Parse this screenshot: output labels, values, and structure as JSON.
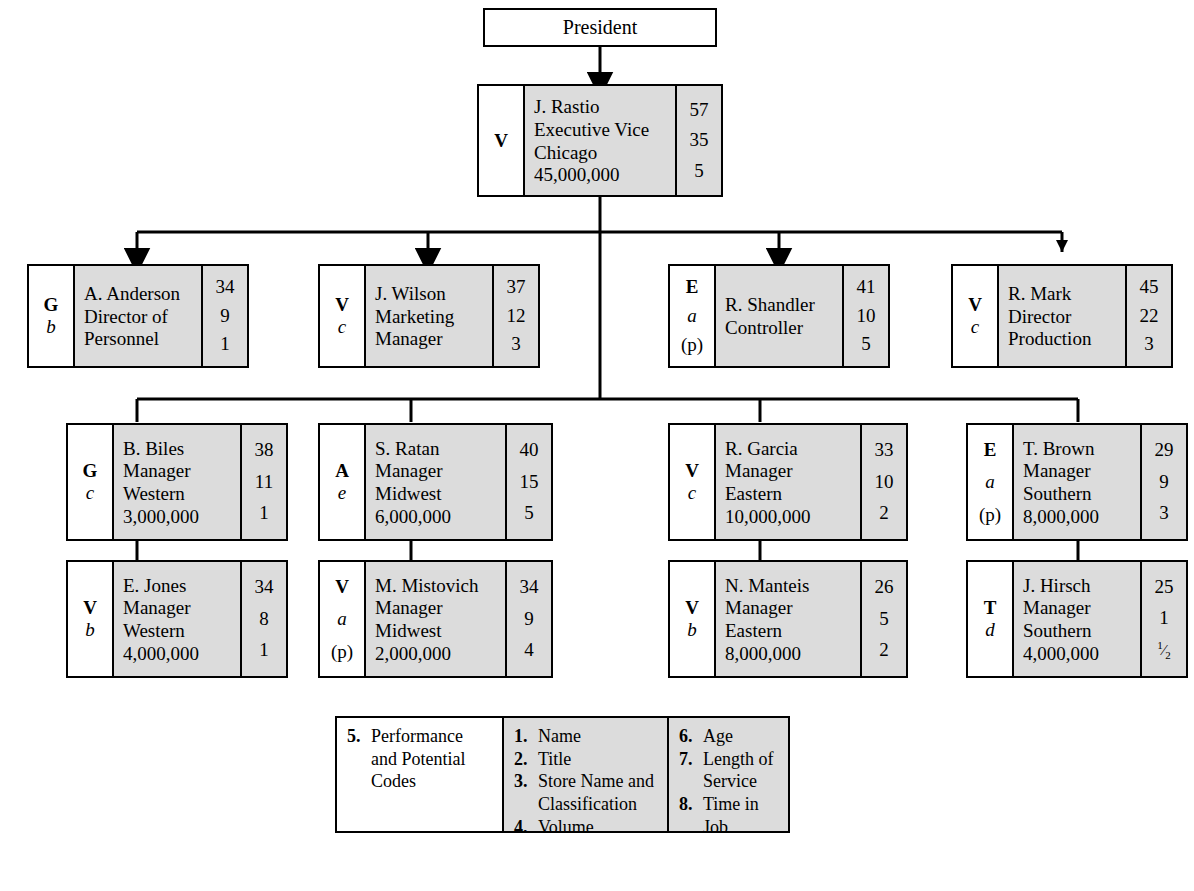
{
  "chart_title": "Organization Chart",
  "root": {
    "label": "President"
  },
  "nodes": [
    {
      "id": "rastio",
      "perf_code": "V",
      "potential_code": "",
      "paren_code": "",
      "name": "J. Rastio",
      "title": "Executive Vice",
      "store": "Chicago",
      "volume": "45,000,000",
      "age": "57",
      "length_of_service": "35",
      "time_in_job": "5"
    },
    {
      "id": "anderson",
      "perf_code": "G",
      "potential_code": "b",
      "paren_code": "",
      "name": "A. Anderson",
      "title": "Director of",
      "store": "Personnel",
      "volume": "",
      "age": "34",
      "length_of_service": "9",
      "time_in_job": "1"
    },
    {
      "id": "wilson",
      "perf_code": "V",
      "potential_code": "c",
      "paren_code": "",
      "name": "J. Wilson",
      "title": "Marketing",
      "store": "Manager",
      "volume": "",
      "age": "37",
      "length_of_service": "12",
      "time_in_job": "3"
    },
    {
      "id": "shandler",
      "perf_code": "E",
      "potential_code": "a",
      "paren_code": "(p)",
      "name": "R. Shandler",
      "title": "Controller",
      "store": "",
      "volume": "",
      "age": "41",
      "length_of_service": "10",
      "time_in_job": "5"
    },
    {
      "id": "mark",
      "perf_code": "V",
      "potential_code": "c",
      "paren_code": "",
      "name": "R. Mark",
      "title": "Director",
      "store": "Production",
      "volume": "",
      "age": "45",
      "length_of_service": "22",
      "time_in_job": "3"
    },
    {
      "id": "biles",
      "perf_code": "G",
      "potential_code": "c",
      "paren_code": "",
      "name": "B. Biles",
      "title": "Manager",
      "store": "Western",
      "volume": "3,000,000",
      "age": "38",
      "length_of_service": "11",
      "time_in_job": "1"
    },
    {
      "id": "ratan",
      "perf_code": "A",
      "potential_code": "e",
      "paren_code": "",
      "name": "S. Ratan",
      "title": "Manager",
      "store": "Midwest",
      "volume": "6,000,000",
      "age": "40",
      "length_of_service": "15",
      "time_in_job": "5"
    },
    {
      "id": "garcia",
      "perf_code": "V",
      "potential_code": "c",
      "paren_code": "",
      "name": "R. Garcia",
      "title": "Manager",
      "store": "Eastern",
      "volume": "10,000,000",
      "age": "33",
      "length_of_service": "10",
      "time_in_job": "2"
    },
    {
      "id": "brown",
      "perf_code": "E",
      "potential_code": "a",
      "paren_code": "(p)",
      "name": "T. Brown",
      "title": "Manager",
      "store": "Southern",
      "volume": "8,000,000",
      "age": "29",
      "length_of_service": "9",
      "time_in_job": "3"
    },
    {
      "id": "jones",
      "perf_code": "V",
      "potential_code": "b",
      "paren_code": "",
      "name": "E. Jones",
      "title": "Manager",
      "store": "Western",
      "volume": "4,000,000",
      "age": "34",
      "length_of_service": "8",
      "time_in_job": "1"
    },
    {
      "id": "mistovich",
      "perf_code": "V",
      "potential_code": "a",
      "paren_code": "(p)",
      "name": "M. Mistovich",
      "title": "Manager",
      "store": "Midwest",
      "volume": "2,000,000",
      "age": "34",
      "length_of_service": "9",
      "time_in_job": "4"
    },
    {
      "id": "manteis",
      "perf_code": "V",
      "potential_code": "b",
      "paren_code": "",
      "name": "N. Manteis",
      "title": "Manager",
      "store": "Eastern",
      "volume": "8,000,000",
      "age": "26",
      "length_of_service": "5",
      "time_in_job": "2"
    },
    {
      "id": "hirsch",
      "perf_code": "T",
      "potential_code": "d",
      "paren_code": "",
      "name": "J. Hirsch",
      "title": "Manager",
      "store": "Southern",
      "volume": "4,000,000",
      "age": "25",
      "length_of_service": "1",
      "time_in_job": "1/2"
    }
  ],
  "legend": {
    "col1": [
      {
        "num": "5.",
        "text": "Performance",
        "cont1": "and Potential",
        "cont2": "Codes"
      }
    ],
    "col2": [
      {
        "num": "1.",
        "text": "Name",
        "cont1": "",
        "cont2": ""
      },
      {
        "num": "2.",
        "text": "Title",
        "cont1": "",
        "cont2": ""
      },
      {
        "num": "3.",
        "text": "Store Name and",
        "cont1": "Classification",
        "cont2": ""
      },
      {
        "num": "4.",
        "text": "Volume",
        "cont1": "",
        "cont2": ""
      }
    ],
    "col3": [
      {
        "num": "6.",
        "text": "Age",
        "cont1": "",
        "cont2": ""
      },
      {
        "num": "7.",
        "text": "Length of",
        "cont1": "Service",
        "cont2": ""
      },
      {
        "num": "8.",
        "text": "Time in Job",
        "cont1": "",
        "cont2": ""
      }
    ]
  },
  "colors": {
    "box_fill": "#dcdcdc",
    "code_fill": "#ffffff",
    "border": "#000000",
    "page_background": "#ffffff"
  }
}
